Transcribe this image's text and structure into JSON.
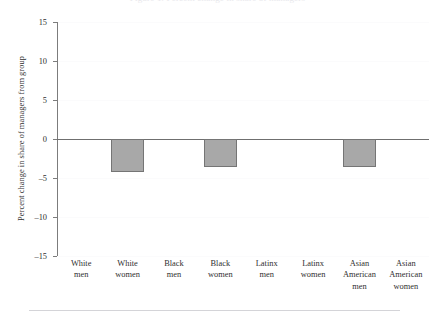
{
  "page": {
    "cutoff_title": "Figure 1. Percent change in share of managers",
    "footer_rule": "horizontal-rule"
  },
  "chart_data": {
    "type": "bar",
    "title": "",
    "subtitle": "",
    "xlabel": "",
    "ylabel": "Percent change in share of managers from group",
    "categories": [
      "White men",
      "White women",
      "Black men",
      "Black women",
      "Latinx men",
      "Latinx women",
      "Asian American men",
      "Asian American women"
    ],
    "category_lines": [
      [
        "White",
        "men"
      ],
      [
        "White",
        "women"
      ],
      [
        "Black",
        "men"
      ],
      [
        "Black",
        "women"
      ],
      [
        "Latinx",
        "men"
      ],
      [
        "Latinx",
        "women"
      ],
      [
        "Asian",
        "American",
        "men"
      ],
      [
        "Asian",
        "American",
        "women"
      ]
    ],
    "values": [
      0,
      -4.2,
      0,
      -3.6,
      0,
      0,
      -3.6,
      0
    ],
    "ylim": [
      -15,
      15
    ],
    "yticks": [
      15,
      10,
      5,
      0,
      -5,
      -10,
      -15
    ],
    "ytick_labels": [
      "15",
      "10",
      "5",
      "0",
      "–5",
      "–10",
      "–15"
    ],
    "grid": false,
    "legend": "none",
    "baseline": 0,
    "bar_color": "#a8a8a8",
    "bar_edge_color": "#757575",
    "axis_color": "#7c7c7c",
    "baseline_color": "#6f6f6f",
    "text_color": "#2f2f2f",
    "background": "#ffffff"
  }
}
